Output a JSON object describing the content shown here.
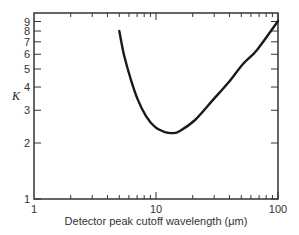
{
  "chart_data": {
    "type": "line",
    "title": "",
    "xlabel": "Detector peak cutoff wavelength (μm)",
    "ylabel": "K",
    "xscale": "log",
    "yscale": "log",
    "xlim": [
      1,
      100
    ],
    "ylim": [
      1,
      10
    ],
    "grid": false,
    "legend": null,
    "x_ticks": [
      1,
      10,
      100
    ],
    "x_tick_labels": [
      "1",
      "10",
      "100"
    ],
    "y_ticks": [
      1,
      2,
      3,
      4,
      5,
      6,
      7,
      8,
      9
    ],
    "y_tick_labels": [
      "1",
      "2",
      "3",
      "4",
      "5",
      "6",
      "7",
      "8",
      "9"
    ],
    "series": [
      {
        "name": "K",
        "x": [
          5.0,
          5.47,
          6.24,
          7.11,
          8.28,
          9.81,
          11.85,
          13.8,
          15.7,
          20.9,
          29.3,
          38.9,
          51.7,
          67.3,
          100
        ],
        "y": [
          8.0,
          5.94,
          4.36,
          3.41,
          2.79,
          2.44,
          2.29,
          2.26,
          2.32,
          2.66,
          3.41,
          4.2,
          5.32,
          6.33,
          9.06
        ],
        "color": "#1a1a1a"
      }
    ]
  },
  "plot_box": {
    "left": 34,
    "top": 13,
    "right": 278,
    "bottom": 199
  }
}
